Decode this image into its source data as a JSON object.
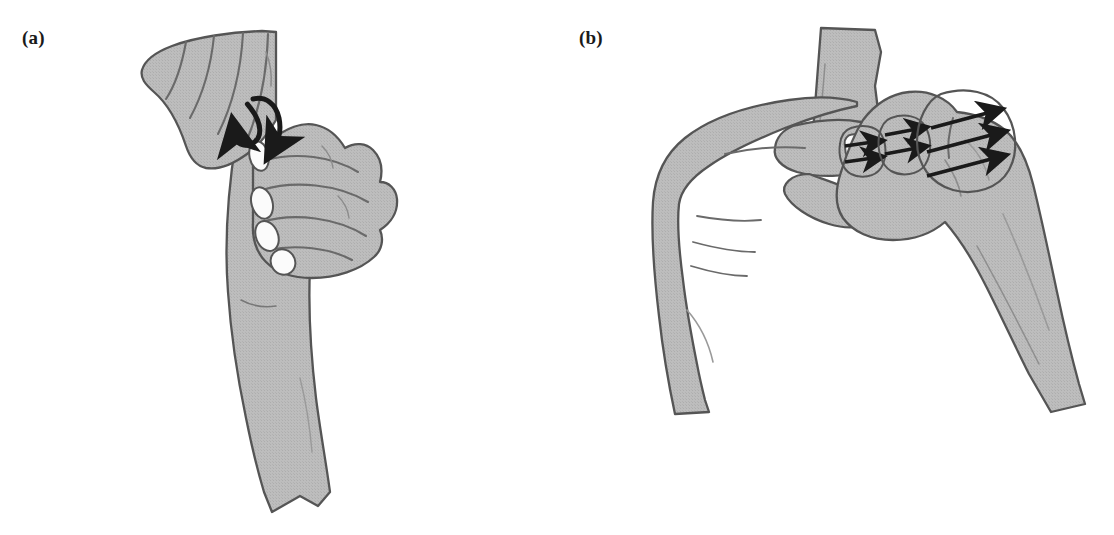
{
  "figure": {
    "background_color": "#ffffff",
    "width": 1114,
    "height": 535,
    "panel_count": 2
  },
  "style": {
    "skin_fill": "#b9b9b9",
    "skin_fill_light": "#c2c2c2",
    "outline_color": "#555555",
    "crease_color": "#6a6a6a",
    "nail_fill": "#fbfbfb",
    "arrow_color": "#1a1a1a",
    "label_color": "#1a1a1a"
  },
  "panels": [
    {
      "id": "a",
      "label": "(a)",
      "description": "Examiner's hand grasping a patient's forearm and wrist; a curved double-headed arrow indicates a rocking or rotational anterior-posterior glide at the joint.",
      "motion": {
        "type": "curved-double-arrow",
        "direction": "bidirectional-arc",
        "arrow_count": 1,
        "meaning": "rotation / anterior-posterior rocking"
      },
      "anatomy": {
        "upper_hand": "patient fingers and hand angled to upper left",
        "lower_hand": "examiner hand gripping with four fingernails visible",
        "forearm": "long tapering forearm descending to a sleeve cuff",
        "visible_nails": 4
      }
    },
    {
      "id": "b",
      "label": "(b)",
      "description": "Two hands performing a lateral translation / shear test; straight arrows over the carpal region indicate a side-to-side gliding force.",
      "motion": {
        "type": "straight-arrows",
        "direction": "right",
        "groups": [
          {
            "name": "large-oval-region",
            "arrow_count": 3,
            "arrow_length": "long"
          },
          {
            "name": "middle-blob-region",
            "arrow_count": 2,
            "arrow_length": "short"
          },
          {
            "name": "small-blob-region",
            "arrow_count": 2,
            "arrow_length": "short"
          }
        ],
        "total_arrows": 7,
        "meaning": "translation / shear glide"
      },
      "anatomy": {
        "left_hand": "stabilizing hand approaching from the left with two nails visible",
        "right_hand": "mobilizing hand gripping from the right, forearm descending to lower right cuff",
        "vertical_segment": "patient finger/thumb column rising behind the hands",
        "visible_nails": 2
      }
    }
  ]
}
